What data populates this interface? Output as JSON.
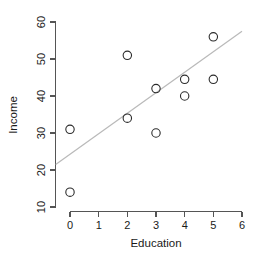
{
  "chart_data": {
    "type": "scatter",
    "title": "",
    "subtitle": "",
    "xlabel": "Education",
    "ylabel": "Income",
    "xlim": [
      0,
      6
    ],
    "ylim": [
      10,
      60
    ],
    "grid": false,
    "legend": false,
    "x_ticks": [
      0,
      1,
      2,
      3,
      4,
      5,
      6
    ],
    "x_tick_labels": [
      "0",
      "1",
      "2",
      "3",
      "4",
      "5",
      "6"
    ],
    "y_ticks": [
      10,
      20,
      30,
      40,
      50,
      60
    ],
    "y_tick_labels": [
      "10",
      "20",
      "30",
      "40",
      "50",
      "60"
    ],
    "marker": "open-circle",
    "marker_color": "#2b2b2b",
    "x": [
      0,
      0,
      2,
      2,
      3,
      3,
      4,
      4,
      5,
      5
    ],
    "y": [
      31,
      14,
      51,
      34,
      42,
      30,
      44.5,
      40,
      56,
      44.5
    ],
    "points": [
      {
        "x": 0,
        "y": 31
      },
      {
        "x": 0,
        "y": 14
      },
      {
        "x": 2,
        "y": 51
      },
      {
        "x": 2,
        "y": 34
      },
      {
        "x": 3,
        "y": 42
      },
      {
        "x": 3,
        "y": 30
      },
      {
        "x": 4,
        "y": 44.5
      },
      {
        "x": 4,
        "y": 40
      },
      {
        "x": 5,
        "y": 56
      },
      {
        "x": 5,
        "y": 44.5
      }
    ],
    "fit_line": {
      "type": "linear-regression",
      "color": "#b9b9b9",
      "x_start": -0.5,
      "y_start": 21.5,
      "x_end": 6.0,
      "y_end": 57.5,
      "slope": 5.54,
      "intercept": 24.3
    }
  },
  "labels": {
    "x_axis_title": "Education",
    "y_axis_title": "Income",
    "x0": "0",
    "x1": "1",
    "x2": "2",
    "x3": "3",
    "x4": "4",
    "x5": "5",
    "x6": "6",
    "y10": "10",
    "y20": "20",
    "y30": "30",
    "y40": "40",
    "y50": "50",
    "y60": "60"
  }
}
